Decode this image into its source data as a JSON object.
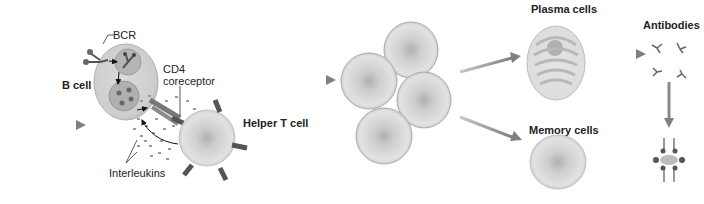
{
  "diagram": {
    "labels": {
      "bcr": "BCR",
      "b_cell": "B cell",
      "cd4_line1": "CD4",
      "cd4_line2": "coreceptor",
      "helper_t": "Helper T cell",
      "interleukins": "Interleukins",
      "plasma_cells": "Plasma cells",
      "antibodies": "Antibodies",
      "memory_cells": "Memory cells"
    },
    "colors": {
      "arrow": "#8a8a8a",
      "cell_fill": "#dcdcdc",
      "cell_core": "#b4b4b4",
      "receptor": "#5a5a5a",
      "text": "#222222"
    },
    "nodes": [
      {
        "id": "b-cell",
        "label": "B cell"
      },
      {
        "id": "helper-t-cell",
        "label": "Helper T cell"
      },
      {
        "id": "clonal-expansion",
        "label": ""
      },
      {
        "id": "plasma-cell",
        "label": "Plasma cells"
      },
      {
        "id": "memory-cell",
        "label": "Memory cells"
      },
      {
        "id": "antibodies",
        "label": "Antibodies"
      },
      {
        "id": "antigen-complex",
        "label": ""
      }
    ],
    "edges": [
      {
        "from": "input",
        "to": "b-cell"
      },
      {
        "from": "b-cell",
        "to": "clonal-expansion"
      },
      {
        "from": "clonal-expansion",
        "to": "plasma-cell"
      },
      {
        "from": "clonal-expansion",
        "to": "memory-cell"
      },
      {
        "from": "plasma-cell",
        "to": "antibodies"
      },
      {
        "from": "antibodies",
        "to": "antigen-complex"
      }
    ]
  }
}
